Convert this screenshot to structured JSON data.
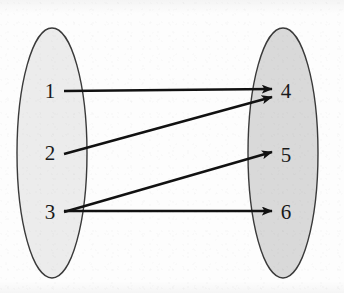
{
  "figure": {
    "type": "set-mapping-diagram",
    "title": "",
    "background_color": "#fdfdfd"
  },
  "sets": [
    {
      "id": "domain",
      "name": "left-set",
      "label": "",
      "fill_color": "#ececec",
      "stroke_color": "#3a3a3a",
      "geometry": {
        "cx": 52,
        "cy": 153,
        "rx": 35,
        "ry": 125
      },
      "elements": [
        {
          "id": "n1",
          "label": "1",
          "x": 50,
          "y": 91
        },
        {
          "id": "n2",
          "label": "2",
          "x": 50,
          "y": 153
        },
        {
          "id": "n3",
          "label": "3",
          "x": 50,
          "y": 212
        }
      ]
    },
    {
      "id": "codomain",
      "name": "right-set",
      "label": "",
      "fill_color": "#d9d9d9",
      "stroke_color": "#3a3a3a",
      "geometry": {
        "cx": 283,
        "cy": 153,
        "rx": 35,
        "ry": 125
      },
      "elements": [
        {
          "id": "n4",
          "label": "4",
          "x": 286,
          "y": 91
        },
        {
          "id": "n5",
          "label": "5",
          "x": 286,
          "y": 155
        },
        {
          "id": "n6",
          "label": "6",
          "x": 286,
          "y": 212
        }
      ]
    }
  ],
  "arrows": [
    {
      "id": "a1",
      "name": "arrow-1-to-4",
      "from": "1",
      "to": "4",
      "x1": 64,
      "y1": 91,
      "x2": 272,
      "y2": 89
    },
    {
      "id": "a2",
      "name": "arrow-2-to-4",
      "from": "2",
      "to": "4",
      "x1": 64,
      "y1": 154,
      "x2": 272,
      "y2": 97
    },
    {
      "id": "a3",
      "name": "arrow-3-to-5",
      "from": "3",
      "to": "5",
      "x1": 64,
      "y1": 212,
      "x2": 272,
      "y2": 152
    },
    {
      "id": "a4",
      "name": "arrow-3-to-6",
      "from": "3",
      "to": "6",
      "x1": 64,
      "y1": 211,
      "x2": 272,
      "y2": 211
    }
  ],
  "style": {
    "line_color": "#111111",
    "line_width": 2.4,
    "label_color": "#1a1a1a",
    "label_font_size": 21
  },
  "chart_data": {
    "type": "diagram",
    "subtype": "mapping",
    "nodes_left": [
      "1",
      "2",
      "3"
    ],
    "nodes_right": [
      "4",
      "5",
      "6"
    ],
    "edges": [
      [
        "1",
        "4"
      ],
      [
        "2",
        "4"
      ],
      [
        "3",
        "5"
      ],
      [
        "3",
        "6"
      ]
    ]
  }
}
